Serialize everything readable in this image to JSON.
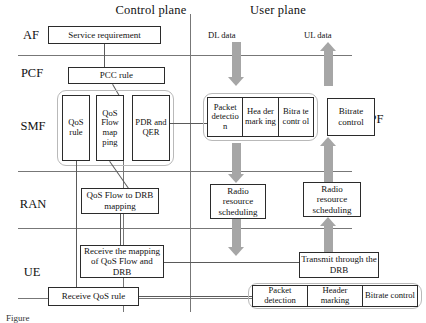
{
  "figure": {
    "planes": {
      "control": "Control plane",
      "user": "User plane"
    },
    "row_labels": [
      "AF",
      "PCF",
      "SMF",
      "RAN",
      "UE"
    ],
    "side_label": "UPF",
    "flow_labels": {
      "downlink": "DL data",
      "uplink": "UL data"
    },
    "caption": "Figure"
  },
  "control_plane": {
    "af_box": "Service requirement",
    "pcf_box": "PCC rule",
    "smf_boxes": [
      "QoS rule",
      "QoS Flow map ping",
      "PDR and QER"
    ],
    "ran_box": "QoS Flow to DRB mapping",
    "ue_boxes": [
      "Receive the mapping of QoS Flow and DRB",
      "Receive QoS rule"
    ]
  },
  "user_plane": {
    "upf_strip": [
      "Packet detectio n",
      "Hea der mark ing",
      "Bitra te contr ol"
    ],
    "upf_bitrate": "Bitrate control",
    "ran_downlink": "Radio resource scheduling",
    "ran_uplink": "Radio resource scheduling",
    "ue_transmit": "Transmit through the DRB",
    "ue_strip": [
      "Packet detection",
      "Header marking",
      "Bitrate control"
    ]
  },
  "colors": {
    "arrow": "#a6a6a6",
    "line": "#5a5a5a",
    "box_border": "#2b2b2b"
  }
}
